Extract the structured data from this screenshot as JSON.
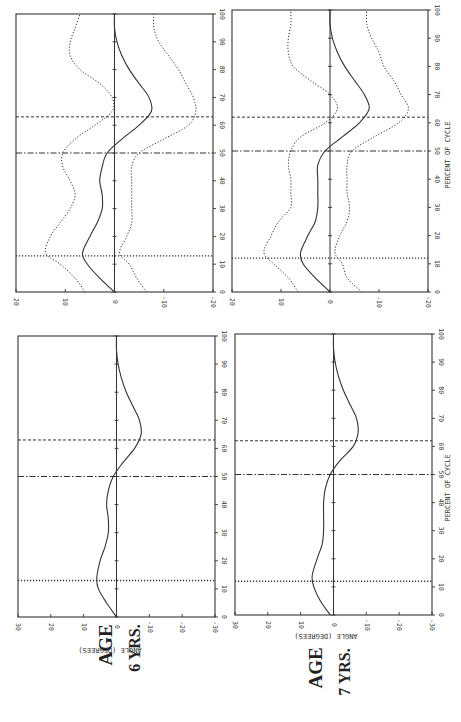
{
  "figure": {
    "orientation": "rotated-90-clockwise",
    "age_labels": [
      {
        "age": "AGE",
        "years": "6 YRS."
      },
      {
        "age": "AGE",
        "years": "7 YRS."
      }
    ],
    "x_axis_label": "PERCENT OF CYCLE",
    "y_axis_label": "ANGLE  (DEGREES)"
  },
  "chart_data": [
    {
      "id": "age6-mean",
      "type": "line",
      "title": "AGE 6 YRS.",
      "xlabel": "PERCENT OF CYCLE",
      "ylabel": "ANGLE (DEGREES)",
      "xlim": [
        0,
        100
      ],
      "ylim": [
        -30,
        30
      ],
      "xticks": [
        0,
        10,
        20,
        30,
        40,
        50,
        60,
        70,
        80,
        90,
        100
      ],
      "yticks": [
        30,
        20,
        10,
        0,
        -10,
        -20,
        -30
      ],
      "grid": false,
      "vlines": [
        {
          "x": 13,
          "style": "dotted"
        },
        {
          "x": 50,
          "style": "dash-dot"
        },
        {
          "x": 63,
          "style": "dashed"
        }
      ],
      "series": [
        {
          "name": "mean",
          "style": "solid",
          "x": [
            0,
            5,
            10,
            14,
            20,
            25,
            30,
            35,
            40,
            45,
            50,
            55,
            60,
            65,
            70,
            75,
            80,
            85,
            90,
            95,
            100
          ],
          "y": [
            0,
            3,
            5.5,
            6,
            5,
            3.5,
            2.5,
            2.5,
            3,
            2.5,
            1,
            -2,
            -5.5,
            -7.5,
            -7,
            -5,
            -3,
            -1.5,
            -0.5,
            0,
            0
          ]
        }
      ]
    },
    {
      "id": "age7-mean",
      "type": "line",
      "title": "AGE 7 YRS.",
      "xlabel": "PERCENT OF CYCLE",
      "ylabel": "ANGLE (DEGREES)",
      "xlim": [
        0,
        100
      ],
      "ylim": [
        -30,
        30
      ],
      "xticks": [
        0,
        10,
        20,
        30,
        40,
        50,
        60,
        70,
        80,
        90,
        100
      ],
      "yticks": [
        30,
        20,
        10,
        0,
        -10,
        -20,
        -30
      ],
      "grid": false,
      "vlines": [
        {
          "x": 12,
          "style": "dotted"
        },
        {
          "x": 50,
          "style": "dash-dot"
        },
        {
          "x": 62,
          "style": "dashed"
        }
      ],
      "series": [
        {
          "name": "mean",
          "style": "solid",
          "x": [
            0,
            5,
            10,
            14,
            20,
            25,
            30,
            35,
            40,
            45,
            50,
            55,
            60,
            65,
            70,
            75,
            80,
            85,
            90,
            95,
            100
          ],
          "y": [
            1,
            4,
            6,
            6.5,
            5,
            3.5,
            3,
            3,
            3,
            2.5,
            1,
            -2,
            -6,
            -7.5,
            -7,
            -5,
            -3,
            -1.5,
            -0.5,
            0,
            0
          ]
        }
      ]
    },
    {
      "id": "age6-band",
      "type": "line",
      "title": "AGE 6 YRS. (mean ± SD)",
      "xlabel": "",
      "ylabel": "",
      "xlim": [
        0,
        100
      ],
      "ylim": [
        -20,
        20
      ],
      "xticks": [
        0,
        10,
        20,
        30,
        40,
        50,
        60,
        70,
        80,
        90,
        100
      ],
      "yticks": [
        20,
        10,
        0,
        -10,
        -20
      ],
      "grid": false,
      "vlines": [
        {
          "x": 13,
          "style": "dotted"
        },
        {
          "x": 50,
          "style": "dash-dot"
        },
        {
          "x": 63,
          "style": "dashed"
        }
      ],
      "series": [
        {
          "name": "mean",
          "style": "solid",
          "x": [
            0,
            5,
            10,
            14,
            20,
            25,
            30,
            35,
            40,
            45,
            50,
            55,
            60,
            65,
            70,
            75,
            80,
            85,
            90,
            95,
            100
          ],
          "y": [
            0,
            3,
            5.5,
            6.5,
            5,
            3.5,
            2.5,
            2.5,
            3,
            2.5,
            1.5,
            -1.5,
            -5,
            -7.5,
            -7,
            -5,
            -3,
            -1.5,
            -0.5,
            0,
            0
          ]
        },
        {
          "name": "upper",
          "style": "dotted",
          "x": [
            0,
            5,
            10,
            14,
            20,
            25,
            30,
            35,
            40,
            45,
            50,
            55,
            60,
            65,
            70,
            75,
            80,
            85,
            90,
            95,
            100
          ],
          "y": [
            6,
            8,
            11,
            14,
            13,
            11,
            9,
            8,
            9,
            10.5,
            10.5,
            8,
            4,
            0.5,
            0.5,
            3,
            7,
            9,
            9,
            8,
            7
          ]
        },
        {
          "name": "lower",
          "style": "dotted",
          "x": [
            0,
            5,
            10,
            14,
            20,
            25,
            30,
            35,
            40,
            45,
            50,
            55,
            60,
            65,
            70,
            75,
            80,
            85,
            90,
            95,
            100
          ],
          "y": [
            -6.5,
            -4.5,
            -3,
            -1,
            -2.5,
            -3.5,
            -3.5,
            -3.5,
            -3.5,
            -3.5,
            -5,
            -10,
            -15,
            -16.5,
            -16,
            -14.5,
            -13,
            -11,
            -9,
            -8,
            -8
          ]
        }
      ]
    },
    {
      "id": "age7-band",
      "type": "line",
      "title": "AGE 7 YRS. (mean ± SD)",
      "xlabel": "PERCENT OF CYCLE",
      "ylabel": "",
      "xlim": [
        0,
        100
      ],
      "ylim": [
        -20,
        20
      ],
      "xticks": [
        0,
        10,
        20,
        30,
        40,
        50,
        60,
        70,
        80,
        90,
        100
      ],
      "yticks": [
        20,
        10,
        0,
        -10,
        -20
      ],
      "grid": false,
      "vlines": [
        {
          "x": 12,
          "style": "dotted"
        },
        {
          "x": 50,
          "style": "dash-dot"
        },
        {
          "x": 62,
          "style": "dashed"
        }
      ],
      "series": [
        {
          "name": "mean",
          "style": "solid",
          "x": [
            0,
            5,
            10,
            14,
            20,
            25,
            30,
            35,
            40,
            45,
            50,
            55,
            60,
            65,
            70,
            75,
            80,
            85,
            90,
            95,
            100
          ],
          "y": [
            0,
            3,
            5.5,
            6,
            4.5,
            3,
            2.5,
            2.5,
            2.5,
            2.5,
            1,
            -2.5,
            -6,
            -8,
            -7,
            -5,
            -3,
            -1.5,
            -0.5,
            0,
            0
          ]
        },
        {
          "name": "upper",
          "style": "dotted",
          "x": [
            0,
            5,
            10,
            14,
            20,
            25,
            30,
            35,
            40,
            45,
            50,
            55,
            60,
            65,
            70,
            75,
            80,
            85,
            90,
            95,
            100
          ],
          "y": [
            6.5,
            8.5,
            11.5,
            13.5,
            12,
            10.5,
            8,
            8,
            8,
            8.5,
            8,
            6,
            1,
            -1.5,
            0,
            4,
            7.5,
            8.5,
            8.5,
            8,
            8
          ]
        },
        {
          "name": "lower",
          "style": "dotted",
          "x": [
            0,
            5,
            10,
            14,
            20,
            25,
            30,
            35,
            40,
            45,
            50,
            55,
            60,
            65,
            70,
            75,
            80,
            85,
            90,
            95,
            100
          ],
          "y": [
            -6.5,
            -3.5,
            -2.5,
            -1,
            -2,
            -3.5,
            -4,
            -3.5,
            -3.5,
            -3.5,
            -4.5,
            -9,
            -14,
            -16,
            -14.5,
            -13,
            -11,
            -10,
            -8.5,
            -7.5,
            -7.5
          ]
        }
      ]
    }
  ]
}
